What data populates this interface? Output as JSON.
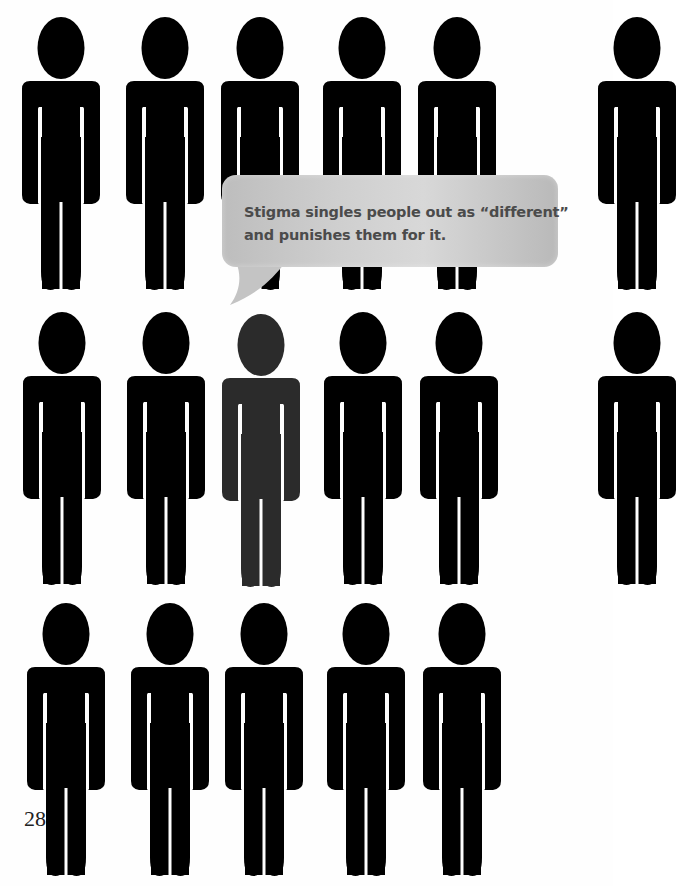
{
  "page": {
    "background": "#ffffff",
    "page_number": "28"
  },
  "callout": {
    "lines": [
      "Stigma singles people out as “different”",
      "and punishes them for it."
    ],
    "text_color": "#4b4b4b",
    "bubble_color": "#c8c8c8"
  },
  "figures": {
    "default_color": "#000000",
    "highlight_color": "#2b2b2b",
    "rows": [
      {
        "top": 17,
        "lefts": [
          22,
          126,
          221,
          323,
          418
        ],
        "partial_right": true
      },
      {
        "top": 312,
        "lefts": [
          23,
          127,
          222,
          324,
          420
        ],
        "partial_right": true,
        "highlighted_index": 2
      },
      {
        "top": 603,
        "lefts": [
          27,
          131,
          225,
          327,
          423
        ],
        "partial_right": false
      }
    ]
  },
  "icons": {
    "person": "person-pictogram-icon",
    "speech_bubble": "speech-bubble-icon"
  }
}
